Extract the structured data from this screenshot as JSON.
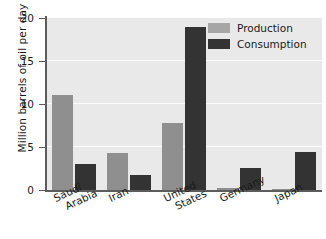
{
  "chart_data": {
    "type": "bar",
    "title": "",
    "xlabel": "",
    "ylabel": "Million barrels of oil per day",
    "categories": [
      "Saudi Arabia",
      "Iran",
      "United States",
      "Germany",
      "Japan"
    ],
    "category_lines": [
      [
        "Saudi",
        "Arabia"
      ],
      [
        "Iran"
      ],
      [
        "United",
        "States"
      ],
      [
        "Germany"
      ],
      [
        "Japan"
      ]
    ],
    "series": [
      {
        "name": "Production",
        "color": "#8f8f8f",
        "values": [
          11.1,
          4.3,
          7.8,
          0.2,
          0.1
        ]
      },
      {
        "name": "Consumption",
        "color": "#333333",
        "values": [
          3.0,
          1.7,
          19.0,
          2.6,
          4.4
        ]
      }
    ],
    "ylim": [
      0,
      20
    ],
    "yticks": [
      0,
      5,
      10,
      15,
      20
    ],
    "ytick_labels": [
      "0",
      "5",
      "10",
      "15",
      "20"
    ],
    "grid": true,
    "legend_position": "top-right",
    "legend_entries": [
      "Production",
      "Consumption"
    ],
    "plot_background": "#e9e9e9",
    "gridline_color": "#fbfbfb",
    "axis_color": "#5c5c5c"
  }
}
